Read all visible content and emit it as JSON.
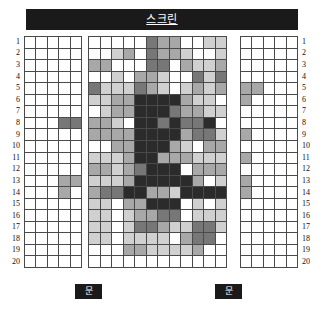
{
  "screen": {
    "label": "스크린"
  },
  "doors": [
    {
      "name": "door-left",
      "label": "문"
    },
    {
      "name": "door-right",
      "label": "문"
    }
  ],
  "row_numbers": [
    "1",
    "2",
    "3",
    "4",
    "5",
    "6",
    "7",
    "8",
    "9",
    "10",
    "11",
    "12",
    "13",
    "14",
    "15",
    "16",
    "17",
    "18",
    "19",
    "20"
  ],
  "legend_colors": {
    "empty": "#ffffff",
    "light": "#d0d0d0",
    "medium": "#a8a8a8",
    "dark": "#777777",
    "darkest": "#2b2b2b",
    "grid_line": "#4a4a4a",
    "banner_background": "#1a1a1a",
    "banner_text": "#ffffff"
  },
  "chart_data": {
    "type": "heatmap",
    "title": "스크린",
    "xlabel": "",
    "ylabel": "",
    "value_scale": [
      0,
      1,
      2,
      3,
      4
    ],
    "value_colors": [
      "#ffffff",
      "#d0d0d0",
      "#a8a8a8",
      "#777777",
      "#2b2b2b"
    ],
    "row_labels": [
      "1",
      "2",
      "3",
      "4",
      "5",
      "6",
      "7",
      "8",
      "9",
      "10",
      "11",
      "12",
      "13",
      "14",
      "15",
      "16",
      "17",
      "18",
      "19",
      "20"
    ],
    "blocks": [
      {
        "name": "block-left",
        "columns": 5,
        "rows": 20,
        "values": [
          [
            0,
            0,
            0,
            0,
            0
          ],
          [
            0,
            0,
            0,
            0,
            0
          ],
          [
            0,
            0,
            0,
            0,
            0
          ],
          [
            0,
            0,
            0,
            0,
            0
          ],
          [
            0,
            0,
            0,
            0,
            0
          ],
          [
            0,
            0,
            0,
            0,
            0
          ],
          [
            0,
            0,
            0,
            0,
            0
          ],
          [
            0,
            0,
            0,
            3,
            3
          ],
          [
            0,
            0,
            0,
            0,
            0
          ],
          [
            0,
            0,
            0,
            0,
            0
          ],
          [
            0,
            0,
            0,
            0,
            0
          ],
          [
            0,
            0,
            0,
            0,
            0
          ],
          [
            0,
            0,
            0,
            2,
            2
          ],
          [
            0,
            0,
            0,
            2,
            0
          ],
          [
            0,
            0,
            0,
            0,
            0
          ],
          [
            0,
            0,
            0,
            0,
            0
          ],
          [
            0,
            0,
            0,
            0,
            0
          ],
          [
            0,
            0,
            0,
            0,
            0
          ],
          [
            0,
            0,
            0,
            0,
            0
          ],
          [
            0,
            0,
            0,
            0,
            0
          ]
        ]
      },
      {
        "name": "block-center",
        "columns": 12,
        "rows": 20,
        "values": [
          [
            0,
            0,
            0,
            0,
            0,
            3,
            2,
            2,
            0,
            0,
            1,
            1
          ],
          [
            0,
            0,
            1,
            2,
            0,
            3,
            2,
            2,
            1,
            0,
            0,
            1
          ],
          [
            2,
            2,
            0,
            0,
            0,
            3,
            3,
            0,
            2,
            1,
            1,
            2
          ],
          [
            0,
            0,
            1,
            0,
            2,
            2,
            1,
            0,
            0,
            3,
            1,
            3
          ],
          [
            3,
            1,
            1,
            1,
            3,
            2,
            1,
            0,
            1,
            2,
            1,
            2
          ],
          [
            1,
            1,
            2,
            2,
            4,
            4,
            4,
            4,
            2,
            1,
            1,
            0
          ],
          [
            0,
            1,
            2,
            2,
            4,
            4,
            4,
            3,
            2,
            2,
            1,
            1
          ],
          [
            2,
            2,
            1,
            0,
            4,
            4,
            3,
            4,
            3,
            3,
            4,
            0
          ],
          [
            2,
            2,
            2,
            2,
            4,
            4,
            4,
            4,
            2,
            3,
            3,
            1
          ],
          [
            0,
            0,
            2,
            2,
            4,
            4,
            4,
            2,
            1,
            0,
            2,
            2
          ],
          [
            1,
            1,
            1,
            2,
            4,
            4,
            2,
            2,
            2,
            1,
            1,
            1
          ],
          [
            2,
            2,
            1,
            2,
            3,
            4,
            4,
            4,
            0,
            2,
            2,
            2
          ],
          [
            1,
            1,
            1,
            2,
            4,
            4,
            4,
            4,
            4,
            2,
            0,
            1
          ],
          [
            2,
            3,
            3,
            4,
            4,
            2,
            2,
            1,
            4,
            4,
            4,
            4
          ],
          [
            1,
            1,
            0,
            2,
            2,
            4,
            4,
            4,
            0,
            1,
            0,
            1
          ],
          [
            1,
            1,
            0,
            1,
            2,
            2,
            3,
            3,
            0,
            1,
            1,
            1
          ],
          [
            1,
            1,
            0,
            1,
            3,
            3,
            2,
            1,
            1,
            3,
            3,
            1
          ],
          [
            1,
            1,
            0,
            1,
            1,
            1,
            1,
            0,
            2,
            3,
            3,
            0
          ],
          [
            0,
            0,
            0,
            2,
            2,
            1,
            1,
            1,
            1,
            2,
            0,
            0
          ],
          [
            0,
            0,
            0,
            0,
            0,
            0,
            0,
            0,
            0,
            0,
            0,
            0
          ]
        ]
      },
      {
        "name": "block-right",
        "columns": 5,
        "rows": 20,
        "values": [
          [
            0,
            0,
            0,
            0,
            0
          ],
          [
            0,
            0,
            0,
            0,
            0
          ],
          [
            0,
            0,
            0,
            0,
            0
          ],
          [
            0,
            0,
            0,
            0,
            0
          ],
          [
            2,
            2,
            0,
            0,
            0
          ],
          [
            2,
            0,
            0,
            0,
            0
          ],
          [
            0,
            0,
            0,
            0,
            0
          ],
          [
            0,
            0,
            0,
            0,
            0
          ],
          [
            2,
            0,
            0,
            0,
            0
          ],
          [
            0,
            0,
            0,
            0,
            0
          ],
          [
            2,
            0,
            0,
            0,
            0
          ],
          [
            0,
            0,
            0,
            0,
            0
          ],
          [
            2,
            0,
            0,
            0,
            0
          ],
          [
            2,
            0,
            0,
            0,
            0
          ],
          [
            0,
            0,
            0,
            0,
            0
          ],
          [
            0,
            0,
            0,
            0,
            0
          ],
          [
            0,
            0,
            0,
            0,
            0
          ],
          [
            0,
            0,
            0,
            0,
            0
          ],
          [
            0,
            0,
            0,
            0,
            0
          ],
          [
            0,
            0,
            0,
            0,
            0
          ]
        ]
      }
    ]
  }
}
